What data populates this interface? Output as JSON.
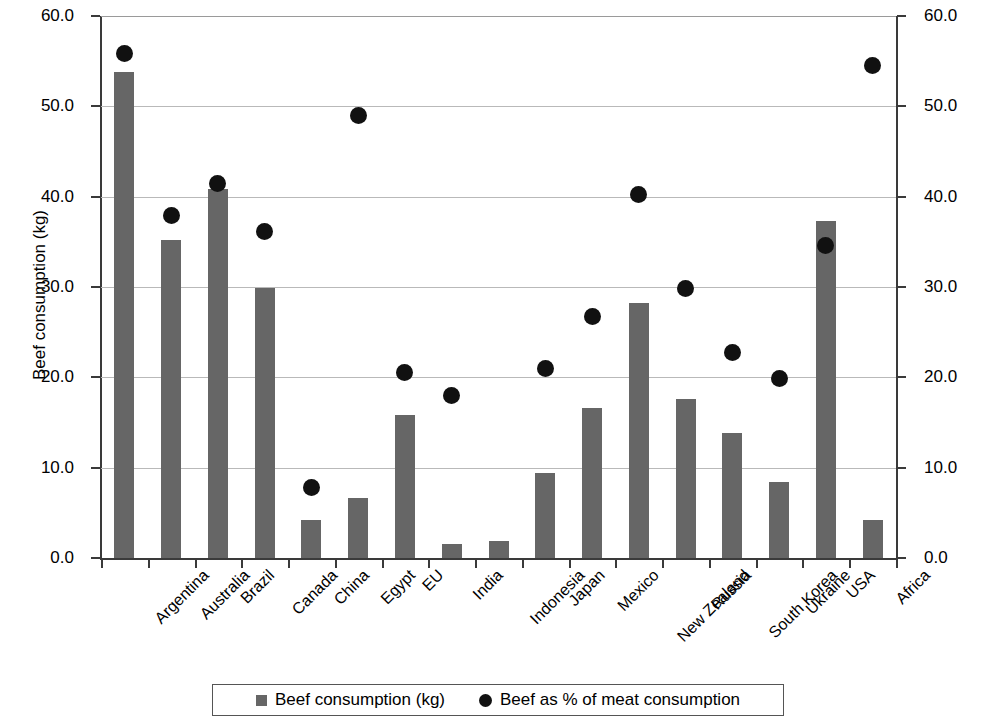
{
  "chart_data": {
    "type": "bar",
    "title": "",
    "subtitle": "",
    "xlabel": "",
    "ylabel": "Beef consumption (kg)",
    "y2label": "Percentage of meat consumption that is beef (%)",
    "grid": true,
    "legend_position": "bottom",
    "ylim": [
      0,
      60
    ],
    "y2lim": [
      0,
      60
    ],
    "ytick_labels": [
      "60.0",
      "50.0",
      "40.0",
      "30.0",
      "20.0",
      "10.0",
      "0.0"
    ],
    "ytick_values": [
      60,
      50,
      40,
      30,
      20,
      10,
      0
    ],
    "y2tick_labels": [
      "60.0",
      "50.0",
      "40.0",
      "30.0",
      "20.0",
      "10.0",
      "0.0"
    ],
    "y2tick_values": [
      60,
      50,
      40,
      30,
      20,
      10,
      0
    ],
    "categories": [
      "Argentina",
      "Australia",
      "Brazil",
      "Canada",
      "China",
      "Egypt",
      "EU",
      "India",
      "Indonesia",
      "Japan",
      "Mexico",
      "New Zealand",
      "Russia",
      "South Korea",
      "Ukraine",
      "USA",
      "Africa"
    ],
    "series": [
      {
        "name": "Beef consumption (kg)",
        "type": "bar",
        "axis": "left",
        "color": "#666666",
        "values": [
          53.8,
          35.2,
          40.9,
          29.9,
          4.2,
          6.6,
          15.8,
          1.5,
          1.9,
          9.4,
          16.6,
          28.2,
          17.6,
          13.8,
          8.4,
          37.3,
          4.2
        ]
      },
      {
        "name": "Beef as % of meat consumption",
        "type": "scatter",
        "axis": "right",
        "color": "#111111",
        "values": [
          55.8,
          37.9,
          41.5,
          36.1,
          7.8,
          49.0,
          20.5,
          18.0,
          null,
          21.0,
          26.7,
          40.2,
          29.8,
          22.8,
          19.9,
          34.6,
          54.5
        ]
      }
    ]
  },
  "legend": {
    "items": [
      {
        "label": "Beef consumption (kg)",
        "marker": "square"
      },
      {
        "label": "Beef as % of meat consumption",
        "marker": "circle"
      }
    ]
  }
}
